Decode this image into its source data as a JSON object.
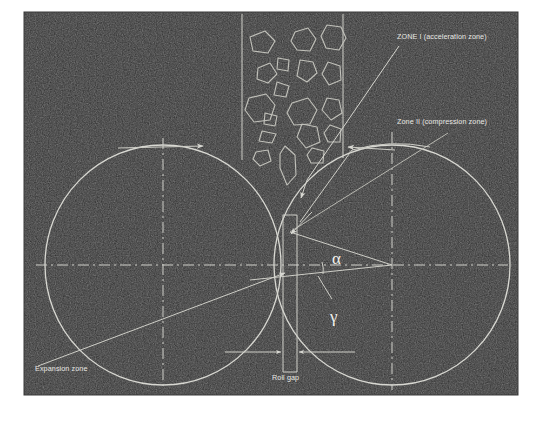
{
  "figure": {
    "frame": {
      "x": 24,
      "y": 12,
      "width": 494,
      "height": 383,
      "background_color": "#2b2b2b",
      "page_background_color": "#ffffff"
    },
    "line_color": "#d0d0ca",
    "text_color": "#e8e8e4"
  },
  "labels": {
    "zone_i": "ZONE I (acceleration zone)",
    "zone_ii": "Zone II (compression zone)",
    "expansion_zone": "Expansion zone",
    "roll_gap": "Roll gap",
    "alpha": "α",
    "gamma": "γ"
  },
  "geometry": {
    "left_roll": {
      "cx": 163,
      "cy": 265,
      "rx": 118,
      "ry": 120
    },
    "right_roll": {
      "cx": 392,
      "cy": 265,
      "rx": 118,
      "ry": 120
    },
    "horizontal_axis_y": 265,
    "roll_gap": {
      "left_x": 283,
      "right_x": 297,
      "top_y": 215,
      "bottom_y": 372
    },
    "hopper": {
      "left_wall_x": 242,
      "right_wall_x": 343,
      "top_y": 14,
      "bottom_y": 160
    },
    "nip_point": {
      "x": 290,
      "y": 232
    }
  },
  "annotations": [
    {
      "name": "zone-i-label",
      "text": "ZONE I (acceleration zone)",
      "x": 397,
      "y": 39
    },
    {
      "name": "zone-ii-label",
      "text": "Zone II (compression zone)",
      "x": 397,
      "y": 124
    },
    {
      "name": "expansion-zone-label",
      "text": "Expansion zone",
      "x": 35,
      "y": 371
    },
    {
      "name": "roll-gap-label",
      "text": "Roll gap",
      "x": 272,
      "y": 380
    },
    {
      "name": "alpha-symbol",
      "text": "α",
      "x": 338,
      "y": 263
    },
    {
      "name": "gamma-symbol",
      "text": "γ",
      "x": 336,
      "y": 318
    }
  ],
  "particles_count": 18,
  "rotation_arrows": {
    "left_roll_direction": "right",
    "right_roll_direction": "left"
  }
}
